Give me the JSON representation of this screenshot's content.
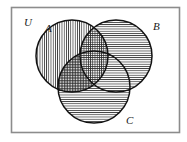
{
  "figure": {
    "type": "venn-diagram",
    "background_color": "#ffffff",
    "border_color": "#8c8c8c",
    "stroke_color": "#111111"
  },
  "universe": {
    "label": "U",
    "label_x": 24,
    "label_y": 26,
    "rect": {
      "x": 11,
      "y": 7,
      "width": 169,
      "height": 126
    }
  },
  "sets": [
    {
      "id": "A",
      "label": "A",
      "label_x": 45,
      "label_y": 32,
      "cx": 72,
      "cy": 56,
      "r": 36,
      "fill_pattern": "vertical-hatch"
    },
    {
      "id": "B",
      "label": "B",
      "label_x": 153,
      "label_y": 30,
      "cx": 116,
      "cy": 56,
      "r": 36,
      "fill_pattern": "horizontal-hatch"
    },
    {
      "id": "C",
      "label": "C",
      "label_x": 126,
      "label_y": 124,
      "cx": 94,
      "cy": 87,
      "r": 36,
      "fill_pattern": "horizontal-hatch"
    }
  ],
  "regions": [
    {
      "name": "A-only",
      "pattern": "vertical-hatch"
    },
    {
      "name": "B-only",
      "pattern": "horizontal-hatch"
    },
    {
      "name": "C-only",
      "pattern": "horizontal-hatch"
    },
    {
      "name": "A-and-B",
      "pattern": "cross-hatch"
    },
    {
      "name": "A-and-C",
      "pattern": "dense-cross-hatch"
    },
    {
      "name": "B-and-C",
      "pattern": "horizontal-hatch"
    },
    {
      "name": "A-and-B-and-C",
      "pattern": "cross-hatch"
    }
  ]
}
